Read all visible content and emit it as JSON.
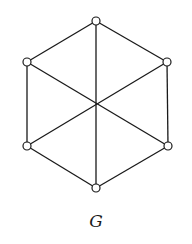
{
  "diagram": {
    "type": "graph",
    "label": "G",
    "vertex_radius": 4,
    "colors": {
      "stroke": "#1a1a1a",
      "vertex_fill": "#ffffff",
      "background": "#ffffff"
    },
    "vertices": [
      {
        "id": "v1",
        "position": "top",
        "x": 96,
        "y": 21
      },
      {
        "id": "v2",
        "position": "upper-right",
        "x": 167,
        "y": 62
      },
      {
        "id": "v3",
        "position": "lower-right",
        "x": 168,
        "y": 146
      },
      {
        "id": "v4",
        "position": "bottom",
        "x": 96,
        "y": 188
      },
      {
        "id": "v5",
        "position": "lower-left",
        "x": 27,
        "y": 146
      },
      {
        "id": "v6",
        "position": "upper-left",
        "x": 27,
        "y": 62
      }
    ],
    "edges": [
      {
        "from": "v1",
        "to": "v2",
        "kind": "perimeter"
      },
      {
        "from": "v2",
        "to": "v3",
        "kind": "perimeter"
      },
      {
        "from": "v3",
        "to": "v4",
        "kind": "perimeter"
      },
      {
        "from": "v4",
        "to": "v5",
        "kind": "perimeter"
      },
      {
        "from": "v5",
        "to": "v6",
        "kind": "perimeter"
      },
      {
        "from": "v6",
        "to": "v1",
        "kind": "perimeter"
      },
      {
        "from": "v1",
        "to": "v4",
        "kind": "diagonal"
      },
      {
        "from": "v2",
        "to": "v5",
        "kind": "diagonal"
      },
      {
        "from": "v6",
        "to": "v3",
        "kind": "diagonal"
      }
    ],
    "center_crossing": {
      "x": 96,
      "y": 104
    }
  }
}
